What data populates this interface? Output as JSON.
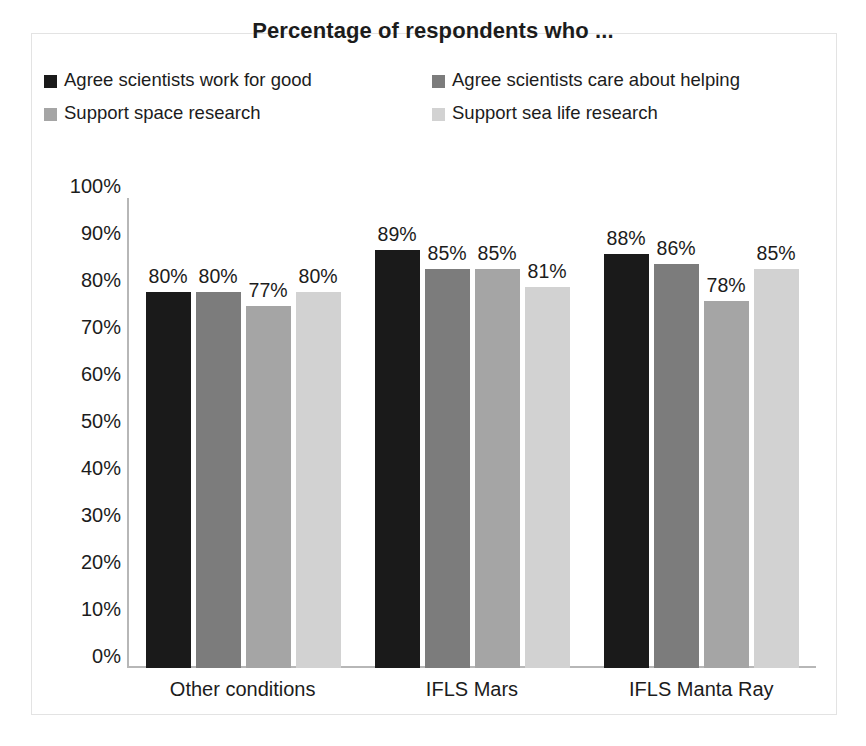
{
  "chart_data": {
    "type": "bar",
    "title": "Percentage of respondents who ...",
    "xlabel": "",
    "ylabel": "",
    "ylim": [
      0,
      100
    ],
    "ytick_labels": [
      "100%",
      "90%",
      "80%",
      "70%",
      "60%",
      "50%",
      "40%",
      "30%",
      "20%",
      "10%",
      "0%"
    ],
    "ytick_values": [
      100,
      90,
      80,
      70,
      60,
      50,
      40,
      30,
      20,
      10,
      0
    ],
    "grid": false,
    "legend_position": "top",
    "categories": [
      "Other conditions",
      "IFLS Mars",
      "IFLS Manta Ray"
    ],
    "series": [
      {
        "name": "Agree scientists work for good",
        "color": "#1a1a1a",
        "values": [
          80,
          89,
          88
        ],
        "labels": [
          "80%",
          "89%",
          "88%"
        ]
      },
      {
        "name": "Agree scientists care about helping",
        "color": "#7c7c7c",
        "values": [
          80,
          85,
          86
        ],
        "labels": [
          "80%",
          "85%",
          "86%"
        ]
      },
      {
        "name": "Support space research",
        "color": "#a5a5a5",
        "values": [
          77,
          85,
          78
        ],
        "labels": [
          "77%",
          "85%",
          "78%"
        ]
      },
      {
        "name": "Support sea life research",
        "color": "#d2d2d2",
        "values": [
          80,
          81,
          85
        ],
        "labels": [
          "80%",
          "81%",
          "85%"
        ]
      }
    ]
  }
}
